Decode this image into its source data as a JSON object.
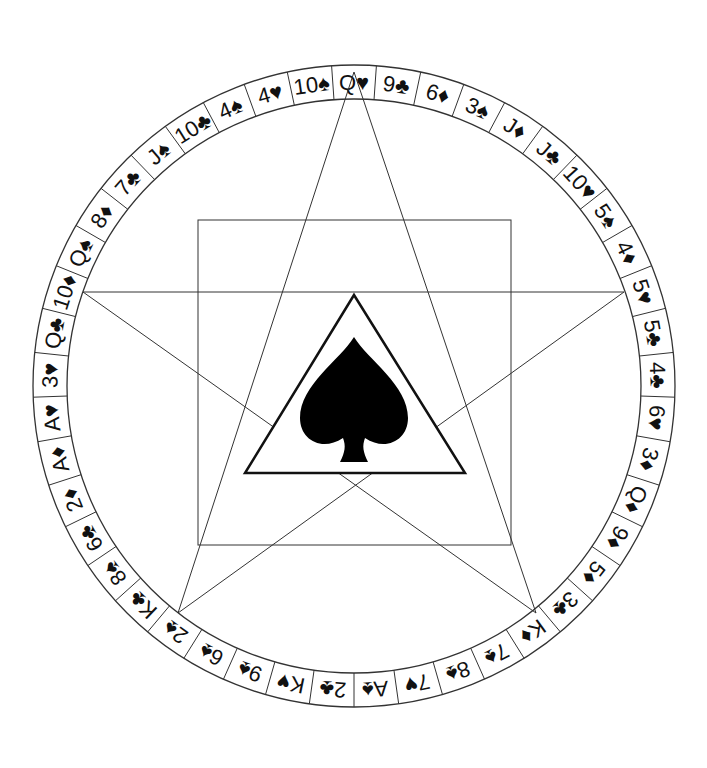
{
  "diagram": {
    "center": [
      354,
      386
    ],
    "outer_radius": 321,
    "inner_radius": 287,
    "stroke_color": "#333333",
    "fill_color": "#000000",
    "ring_cards_clockwise_from_top": [
      "Q♥",
      "9♣",
      "6♦",
      "3♠",
      "J♦",
      "J♣",
      "10♥",
      "5♠",
      "4♦",
      "5♥",
      "5♣",
      "4♣",
      "6♥",
      "3♦",
      "Q♦",
      "9♦",
      "5♦",
      "3♣",
      "K♦",
      "7♠",
      "8♠",
      "7♥",
      "A♠",
      "2♣",
      "K♥",
      "9♠",
      "6♠",
      "2♠",
      "K♣",
      "8♠",
      "6♣",
      "2♦",
      "A♦",
      "A♥",
      "3♥",
      "Q♣",
      "10♦",
      "Q♠",
      "8♦",
      "7♣",
      "J♠",
      "10♣",
      "4♠",
      "4♥",
      "10♠"
    ],
    "star_points": [
      [
        354,
        72
      ],
      [
        536,
        613
      ],
      [
        83,
        292
      ],
      [
        624,
        292
      ],
      [
        178,
        613
      ]
    ],
    "square": {
      "x": 198,
      "y": 220,
      "w": 313,
      "h": 325
    },
    "triangle": [
      [
        354,
        295
      ],
      [
        465,
        473
      ],
      [
        245,
        473
      ]
    ],
    "center_symbol": "spade-icon"
  }
}
